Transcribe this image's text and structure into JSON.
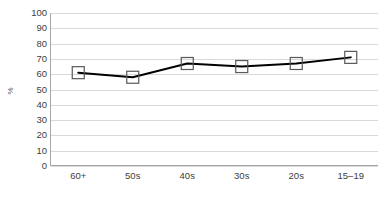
{
  "chart_data": {
    "type": "line",
    "title": "",
    "subtitle": "",
    "xlabel": "",
    "ylabel": "%",
    "categories": [
      "60+",
      "50s",
      "40s",
      "30s",
      "20s",
      "15–19"
    ],
    "series": [
      {
        "name": "",
        "values": [
          61,
          58,
          67,
          65,
          67,
          71
        ],
        "line_color": "#000000",
        "marker": "square-open",
        "marker_fill": "#ffffff",
        "marker_edge": "#595959"
      }
    ],
    "ylim": [
      0,
      100
    ],
    "ytick_step": 10,
    "ytick_labels": [
      "100",
      "90",
      "80",
      "70",
      "60",
      "50",
      "40",
      "30",
      "20",
      "10",
      "0"
    ],
    "grid": {
      "horizontal": true,
      "vertical": false,
      "color": "#d9d9d9"
    },
    "legend": {
      "visible": false,
      "position": "none"
    },
    "axis_color": "#a6a6a6",
    "background_color": "#ffffff",
    "text_color": "#404040"
  }
}
